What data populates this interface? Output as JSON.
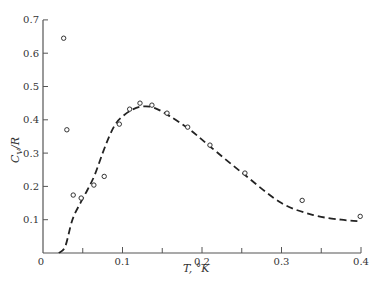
{
  "chart_data": {
    "type": "scatter",
    "title": "",
    "xlabel": "T, °K",
    "ylabel": "C_V/R",
    "xlim": [
      0,
      0.4
    ],
    "ylim": [
      0,
      0.7
    ],
    "grid": false,
    "legend": null,
    "x_ticks": [
      0,
      0.1,
      0.2,
      0.3,
      0.4
    ],
    "x_tick_labels": [
      "0",
      "0.1",
      "0.2",
      "0.3",
      "0.4"
    ],
    "x_minor_ticks": [
      0.05,
      0.15,
      0.25,
      0.35
    ],
    "y_ticks": [
      0.1,
      0.2,
      0.3,
      0.4,
      0.5,
      0.6,
      0.7
    ],
    "y_tick_labels": [
      "0.1",
      "0.2",
      "0.3",
      "0.4",
      "0.5",
      "0.6",
      "0.7"
    ],
    "series": [
      {
        "name": "measured",
        "style": "open-circle",
        "x": [
          0.026,
          0.03,
          0.038,
          0.048,
          0.064,
          0.077,
          0.096,
          0.109,
          0.122,
          0.137,
          0.156,
          0.182,
          0.21,
          0.254,
          0.326,
          0.399
        ],
        "y": [
          0.645,
          0.37,
          0.174,
          0.165,
          0.204,
          0.23,
          0.387,
          0.432,
          0.45,
          0.444,
          0.42,
          0.378,
          0.324,
          0.24,
          0.158,
          0.11
        ]
      },
      {
        "name": "theory",
        "style": "dashed-line",
        "x": [
          0.02,
          0.028,
          0.037,
          0.047,
          0.056,
          0.065,
          0.075,
          0.084,
          0.092,
          0.1,
          0.112,
          0.125,
          0.14,
          0.16,
          0.185,
          0.21,
          0.254,
          0.3,
          0.34,
          0.375,
          0.4
        ],
        "y": [
          0.0,
          0.02,
          0.1,
          0.15,
          0.19,
          0.234,
          0.3,
          0.354,
          0.39,
          0.41,
          0.43,
          0.44,
          0.436,
          0.41,
          0.37,
          0.32,
          0.234,
          0.15,
          0.114,
          0.1,
          0.095
        ]
      }
    ]
  },
  "labels": {
    "ylabel_main": "C",
    "ylabel_sub": "V",
    "ylabel_rest": "/R",
    "xlabel": "T, °K",
    "origin": "0"
  }
}
